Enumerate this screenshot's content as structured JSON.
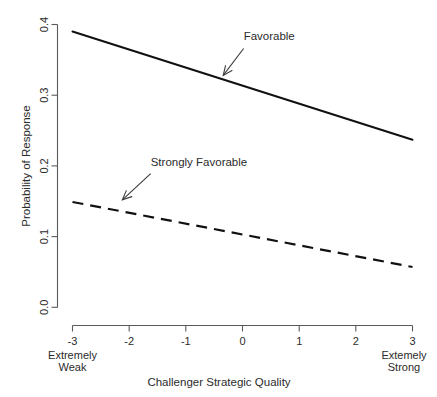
{
  "chart_data": {
    "type": "line",
    "title": "",
    "xlabel": "Challenger Strategic Quality",
    "ylabel": "Probability of Response",
    "xlim": [
      -3,
      3
    ],
    "ylim": [
      0.0,
      0.4
    ],
    "grid": false,
    "legend_position": "inline-annotations",
    "x_ticks": [
      "-3",
      "-2",
      "-1",
      "0",
      "1",
      "2",
      "3"
    ],
    "x_tick_values": [
      -3,
      -2,
      -1,
      0,
      1,
      2,
      3
    ],
    "y_ticks": [
      "0.0",
      "0.1",
      "0.2",
      "0.3",
      "0.4"
    ],
    "y_tick_values": [
      0.0,
      0.1,
      0.2,
      0.3,
      0.4
    ],
    "x_axis_endpoint_labels": {
      "left_line1": "Extremely",
      "left_line2": "Weak",
      "right_line1": "Extemely",
      "right_line2": "Strong"
    },
    "x": [
      -3,
      3
    ],
    "series": [
      {
        "name": "Favorable",
        "style": "solid",
        "color": "#111111",
        "values": [
          0.39,
          0.237
        ]
      },
      {
        "name": "Strongly Favorable",
        "style": "dashed",
        "color": "#111111",
        "values": [
          0.149,
          0.057
        ]
      }
    ],
    "annotations": [
      {
        "text": "Favorable",
        "text_x": 0.02,
        "text_y": 0.378,
        "arrow_from_x": 0.02,
        "arrow_from_y": 0.366,
        "arrow_to_x": -0.34,
        "arrow_to_y": 0.328
      },
      {
        "text": "Strongly Favorable",
        "text_x": -1.62,
        "text_y": 0.2,
        "arrow_from_x": -1.62,
        "arrow_from_y": 0.189,
        "arrow_to_x": -2.12,
        "arrow_to_y": 0.152
      }
    ]
  }
}
